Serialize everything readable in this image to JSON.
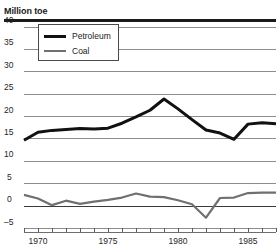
{
  "chart_data": {
    "type": "line",
    "title": "Million toe",
    "xlabel": "",
    "ylabel": "Million toe",
    "ylim": [
      -5,
      40
    ],
    "xlim": [
      1969,
      1987
    ],
    "grid": true,
    "legend_position": "top-left",
    "yticks": [
      40,
      35,
      30,
      25,
      20,
      15,
      10,
      5,
      0,
      -5
    ],
    "ytick_labels": [
      "40",
      "35",
      "30",
      "25",
      "20",
      "15",
      "10",
      "5",
      "0",
      "–5"
    ],
    "xticks": [
      1969,
      1970,
      1971,
      1972,
      1973,
      1974,
      1975,
      1976,
      1977,
      1978,
      1979,
      1980,
      1981,
      1982,
      1983,
      1984,
      1985,
      1986,
      1987
    ],
    "xtick_labels": [
      {
        "x": 1970,
        "label": "1970"
      },
      {
        "x": 1975,
        "label": "1975"
      },
      {
        "x": 1980,
        "label": "1980"
      },
      {
        "x": 1985,
        "label": "1985"
      }
    ],
    "x": [
      1969,
      1970,
      1971,
      1972,
      1973,
      1974,
      1975,
      1976,
      1977,
      1978,
      1979,
      1980,
      1981,
      1982,
      1983,
      1984,
      1985,
      1986,
      1987
    ],
    "series": [
      {
        "name": "Petroleum",
        "color": "#111111",
        "width": 3.0,
        "values": [
          14.6,
          16.4,
          16.8,
          17.0,
          17.2,
          17.1,
          17.3,
          18.4,
          19.8,
          21.3,
          23.8,
          21.6,
          19.2,
          16.9,
          16.2,
          14.8,
          18.2,
          18.5,
          18.3
        ]
      },
      {
        "name": "Coal",
        "color": "#707070",
        "width": 2.2,
        "values": [
          2.4,
          1.6,
          0.1,
          1.1,
          0.4,
          0.9,
          1.3,
          1.8,
          2.7,
          2.0,
          1.9,
          1.2,
          0.3,
          -2.7,
          1.7,
          1.8,
          2.8,
          2.9,
          2.9
        ]
      }
    ]
  },
  "legend": {
    "items": [
      {
        "label": "Petroleum",
        "color": "#111111"
      },
      {
        "label": "Coal",
        "color": "#707070"
      }
    ]
  }
}
